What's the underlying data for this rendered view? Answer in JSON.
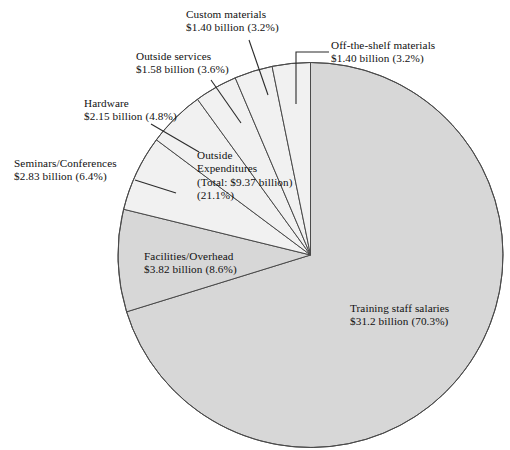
{
  "chart_data": {
    "type": "pie",
    "title": "",
    "subtitle": "",
    "xlabel": "",
    "ylabel": "",
    "legend_position": "none",
    "grid": false,
    "units": "billion USD",
    "total_value": 44.38,
    "slices": [
      {
        "id": "training-staff-salaries",
        "name": "Training staff salaries",
        "value": 31.2,
        "value_label": "$31.2 billion",
        "percent": 70.3,
        "percent_label": "(70.3%)",
        "color": "#d7d7d7",
        "group": "internal",
        "label_placement": "inside"
      },
      {
        "id": "facilities-overhead",
        "name": "Facilities/Overhead",
        "value": 3.82,
        "value_label": "$3.82 billion",
        "percent": 8.6,
        "percent_label": "(8.6%)",
        "color": "#d7d7d7",
        "group": "internal",
        "label_placement": "inside"
      },
      {
        "id": "seminars-conferences",
        "name": "Seminars/Conferences",
        "value": 2.83,
        "value_label": "$2.83 billion",
        "percent": 6.4,
        "percent_label": "(6.4%)",
        "color": "#f1f1f1",
        "group": "outside-expenditures",
        "label_placement": "callout"
      },
      {
        "id": "hardware",
        "name": "Hardware",
        "value": 2.15,
        "value_label": "$2.15 billion",
        "percent": 4.8,
        "percent_label": "(4.8%)",
        "color": "#f1f1f1",
        "group": "outside-expenditures",
        "label_placement": "callout"
      },
      {
        "id": "outside-services",
        "name": "Outside services",
        "value": 1.58,
        "value_label": "$1.58 billion",
        "percent": 3.6,
        "percent_label": "(3.6%)",
        "color": "#f1f1f1",
        "group": "outside-expenditures",
        "label_placement": "callout"
      },
      {
        "id": "custom-materials",
        "name": "Custom materials",
        "value": 1.4,
        "value_label": "$1.40 billion",
        "percent": 3.2,
        "percent_label": "(3.2%)",
        "color": "#f1f1f1",
        "group": "outside-expenditures",
        "label_placement": "callout"
      },
      {
        "id": "off-the-shelf-materials",
        "name": "Off-the-shelf materials",
        "value": 1.4,
        "value_label": "$1.40 billion",
        "percent": 3.2,
        "percent_label": "(3.2%)",
        "color": "#f1f1f1",
        "group": "outside-expenditures",
        "label_placement": "callout"
      }
    ],
    "annotations": [
      {
        "id": "outside-expenditures-group",
        "title": "Outside Expenditures",
        "title_line_1": "Outside",
        "title_line_2": "Expenditures",
        "total_label": "(Total: $9.37 billion)",
        "percent_label": "(21.1%)",
        "total_value": 9.37,
        "percent": 21.1
      }
    ]
  },
  "labels": {
    "custom_materials": {
      "line1": "Custom materials",
      "line2": "$1.40 billion (3.2%)"
    },
    "off_the_shelf": {
      "line1": "Off-the-shelf materials",
      "line2": "$1.40 billion (3.2%)"
    },
    "outside_services": {
      "line1": "Outside services",
      "line2": "$1.58 billion (3.6%)"
    },
    "hardware": {
      "line1": "Hardware",
      "line2": "$2.15 billion (4.8%)"
    },
    "seminars": {
      "line1": "Seminars/Conferences",
      "line2": "$2.83 billion (6.4%)"
    },
    "outside_expenditures": {
      "line1": "Outside",
      "line2": "Expenditures",
      "line3": "(Total: $9.37 billion)",
      "line4": "(21.1%)"
    },
    "facilities": {
      "line1": "Facilities/Overhead",
      "line2": "$3.82 billion (8.6%)"
    },
    "training": {
      "line1": "Training staff salaries",
      "line2": "$31.2 billion (70.3%)"
    }
  },
  "colors": {
    "slice_internal": "#d7d7d7",
    "slice_outside": "#f1f1f1",
    "outline": "#4a4a4a",
    "leader_line": "#2b2b2b",
    "text": "#111111",
    "background": "#ffffff"
  }
}
